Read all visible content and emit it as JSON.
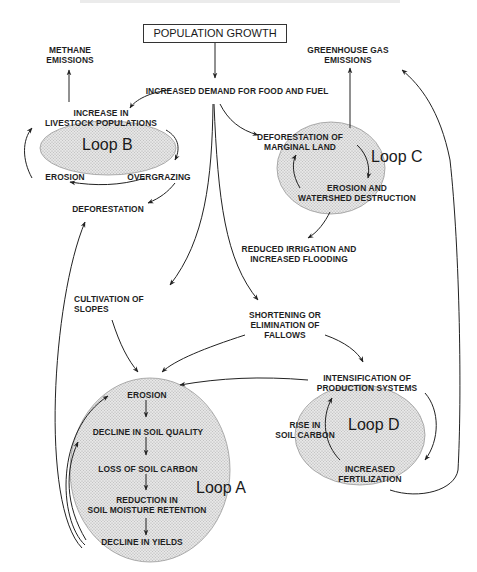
{
  "title": "POPULATION GROWTH",
  "nodes": {
    "methane": [
      "METHANE",
      "EMISSIONS"
    ],
    "greenhouse": [
      "GREENHOUSE GAS",
      "EMISSIONS"
    ],
    "demand": [
      "INCREASED DEMAND FOR FOOD AND FUEL"
    ],
    "livestock": [
      "INCREASE IN",
      "LIVESTOCK POPULATIONS"
    ],
    "erosion_b": [
      "EROSION"
    ],
    "overgrazing": [
      "OVERGRAZING"
    ],
    "deforestation": [
      "DEFORESTATION"
    ],
    "deforestation_marginal": [
      "DEFORESTATION OF",
      "MARGINAL LAND"
    ],
    "erosion_watershed": [
      "EROSION AND",
      "WATERSHED DESTRUCTION"
    ],
    "irrigation": [
      "REDUCED IRRIGATION AND",
      "INCREASED FLOODING"
    ],
    "cultivation": [
      "CULTIVATION OF",
      "SLOPES"
    ],
    "fallows": [
      "SHORTENING OR",
      "ELIMINATION OF",
      "FALLOWS"
    ],
    "intensification": [
      "INTENSIFICATION OF",
      "PRODUCTION SYSTEMS"
    ],
    "soil_carbon_rise": [
      "RISE IN",
      "SOIL CARBON"
    ],
    "fertilization": [
      "INCREASED",
      "FERTILIZATION"
    ],
    "erosion_a": [
      "EROSION"
    ],
    "soil_quality": [
      "DECLINE IN SOIL QUALITY"
    ],
    "soil_carbon_loss": [
      "LOSS OF SOIL CARBON"
    ],
    "moisture": [
      "REDUCTION IN",
      "SOIL MOISTURE RETENTION"
    ],
    "yields": [
      "DECLINE IN YIELDS"
    ]
  },
  "loops": {
    "a": "Loop A",
    "b": "Loop B",
    "c": "Loop C",
    "d": "Loop D"
  },
  "colors": {
    "line": "#222222",
    "loop_fill": "#dcdcdc",
    "loop_stroke": "#888888"
  }
}
